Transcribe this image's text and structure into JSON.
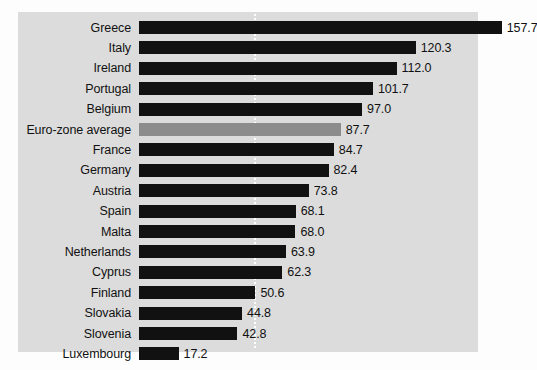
{
  "chart_data": {
    "type": "bar",
    "orientation": "horizontal",
    "title": "",
    "subtitle": "",
    "xlabel": "",
    "ylabel": "",
    "categories": [
      "Greece",
      "Italy",
      "Ireland",
      "Portugal",
      "Belgium",
      "Euro-zone average",
      "France",
      "Germany",
      "Austria",
      "Spain",
      "Malta",
      "Netherlands",
      "Cyprus",
      "Finland",
      "Slovakia",
      "Slovenia",
      "Luxembourg"
    ],
    "values": [
      157.7,
      120.3,
      112.0,
      101.7,
      97.0,
      87.7,
      84.7,
      82.4,
      73.8,
      68.1,
      68.0,
      63.9,
      62.3,
      50.6,
      44.8,
      42.8,
      17.2
    ],
    "value_labels": [
      "157.7",
      "120.3",
      "112.0",
      "101.7",
      "97.0",
      "87.7",
      "84.7",
      "82.4",
      "73.8",
      "68.1",
      "68.0",
      "63.9",
      "62.3",
      "50.6",
      "44.8",
      "42.8",
      "17.2"
    ],
    "highlighted_category": "Euro-zone average",
    "xlim": [
      0,
      170
    ],
    "gridlines": [
      50
    ],
    "grid": true,
    "legend": "none",
    "colors": {
      "bar": "#111111",
      "highlight_bar": "#8c8c8c",
      "panel_background": "#dcdcdc",
      "gridline": "#ffffff",
      "page_background": "#fdfdfd",
      "text": "#111111"
    }
  }
}
